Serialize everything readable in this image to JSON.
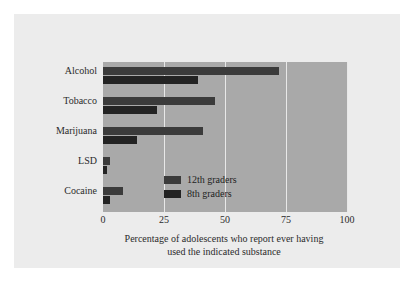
{
  "chart_data": {
    "type": "bar",
    "orientation": "horizontal",
    "title": "",
    "xlabel": "Percentage of adolescents who report ever having used the indicated substance",
    "ylabel": "",
    "xlim": [
      0,
      100
    ],
    "xticks": [
      0,
      25,
      50,
      75,
      100
    ],
    "xtick_labels": [
      "0",
      "25",
      "50",
      "75",
      "100"
    ],
    "grid": true,
    "legend_position": "center",
    "categories": [
      "Alcohol",
      "Tobacco",
      "Marijuana",
      "LSD",
      "Cocaine"
    ],
    "series": [
      {
        "name": "12th graders",
        "color": "#3b3b3b",
        "values": [
          72,
          46,
          41,
          3,
          8
        ]
      },
      {
        "name": "8th graders",
        "color": "#232323",
        "values": [
          39,
          22,
          14,
          1.5,
          3
        ]
      }
    ]
  },
  "caption": {
    "line1": "Percentage of adolescents who report ever having",
    "line2": "used the indicated substance"
  },
  "colors": {
    "page_background": "#ffffff",
    "card_background": "#ececec",
    "plot_background": "#a9a9a9",
    "gridline": "#e8e8e8",
    "series_12th": "#3b3b3b",
    "series_8th": "#232323",
    "text": "#2b2b2b"
  }
}
